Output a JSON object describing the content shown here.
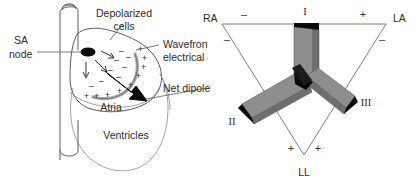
{
  "figure": {
    "background_color": "#ffffff",
    "line_color": "#4a4a4a",
    "vector_fill_color": "#8d8d8d",
    "vector_edge_color": "#111111"
  },
  "left_panel": {
    "name": "heart-diagram",
    "labels": {
      "sa_node_line1": "SA",
      "sa_node_line2": "node",
      "depolarized_line1": "Depolarized",
      "depolarized_line2": "cells",
      "wavefront_line1": "Wavefront of",
      "wavefront_line2": "electrical activity",
      "net_dipole": "Net dipole",
      "atria": "Atria",
      "ventricles": "Ventricles"
    },
    "charges": {
      "negative": "–",
      "positive": "+",
      "negative_count": 8,
      "positive_count": 9
    }
  },
  "right_panel": {
    "name": "einthovens-triangle",
    "vertices": [
      {
        "id": "RA",
        "label": "RA",
        "position": "top-left"
      },
      {
        "id": "LA",
        "label": "LA",
        "position": "top-right"
      },
      {
        "id": "LL",
        "label": "LL",
        "position": "bottom"
      }
    ],
    "leads": [
      {
        "id": "I",
        "label": "I",
        "side": "top",
        "direction": "right"
      },
      {
        "id": "II",
        "label": "II",
        "side": "left",
        "direction": "down-left"
      },
      {
        "id": "III",
        "label": "III",
        "side": "right",
        "direction": "down-right"
      }
    ],
    "polarity_marks": [
      {
        "lead": "I",
        "at": "RA",
        "sign": "–"
      },
      {
        "lead": "I",
        "at": "LA",
        "sign": "+"
      },
      {
        "lead": "II",
        "at": "RA",
        "sign": "–"
      },
      {
        "lead": "II",
        "at": "LL",
        "sign": "+"
      },
      {
        "lead": "III",
        "at": "LA",
        "sign": "–"
      },
      {
        "lead": "III",
        "at": "LL",
        "sign": "+"
      }
    ],
    "signs": {
      "minus": "–",
      "plus": "+"
    }
  }
}
